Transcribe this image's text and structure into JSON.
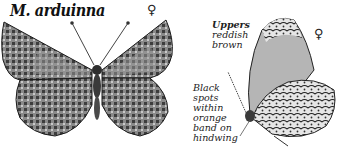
{
  "species": {
    "title": "M. arduinna",
    "upperside_sex_symbol": "♀",
    "underside_sex_symbol": "♀"
  },
  "annotations": {
    "uppers": {
      "head": "Uppers",
      "lines": [
        "reddish",
        "brown"
      ]
    },
    "hindwing": {
      "lines": [
        "Black",
        "spots",
        "within",
        "orange",
        "band on",
        "hindwing"
      ]
    }
  },
  "colors": {
    "ink": "#1a1a1a",
    "wing_dark": "#3a3a3a",
    "wing_mid": "#7a7a7a",
    "wing_light": "#c8c8c8",
    "background": "#ffffff"
  }
}
